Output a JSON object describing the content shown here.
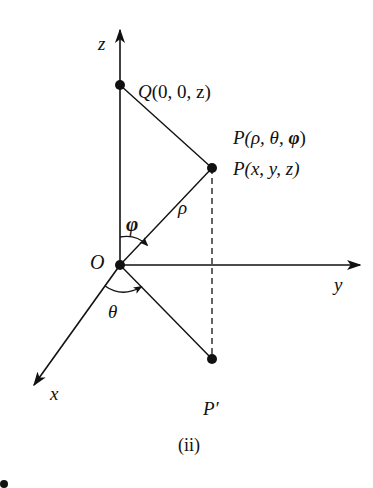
{
  "figure": {
    "caption": "(ii)",
    "type": "spherical-coordinates-diagram",
    "axes": {
      "z_label": "z",
      "y_label": "y",
      "x_label": "x"
    },
    "origin_label": "O",
    "points": {
      "Q": {
        "label_name": "Q",
        "label_args": "(0, 0, z)"
      },
      "P_spherical": {
        "label_name": "P",
        "label_args_pre": "(ρ, θ, ",
        "label_phi": "φ",
        "label_args_post": ")"
      },
      "P_cartesian": {
        "label_name": "P",
        "label_args": "(x, y, z)"
      },
      "P_prime": {
        "label": "P′"
      }
    },
    "angles": {
      "phi": "φ",
      "theta": "θ"
    },
    "segment_labels": {
      "rho": "ρ"
    },
    "colors": {
      "ink": "#111111",
      "background": "#ffffff"
    }
  }
}
